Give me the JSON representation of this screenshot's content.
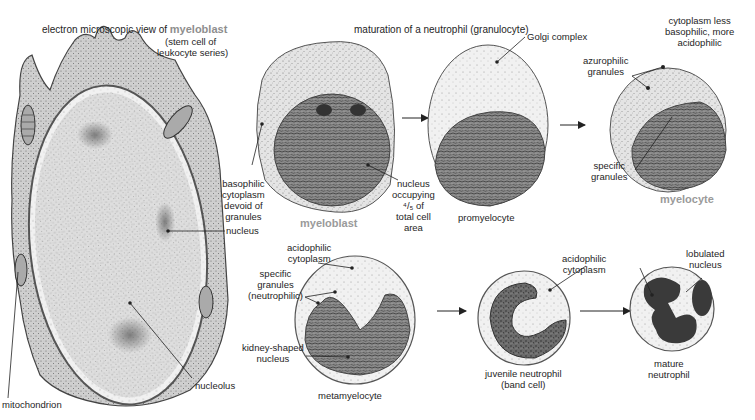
{
  "figure": {
    "header_left": {
      "prefix": "electron microscopic view of",
      "emphasis": "myeloblast",
      "line2": "(stem cell of",
      "line3": "leukocyte series)"
    },
    "header_center": "maturation of a neutrophil (granulocyte)",
    "colors": {
      "background": "#ffffff",
      "cell_stipple": "#bdbdbd",
      "nucleus_dark": "#555555",
      "label_text": "#1e1e1e",
      "stage_title_grey": "#9a9a9a"
    }
  },
  "em_myeloblast": {
    "labels": {
      "nucleus": "nucleus",
      "nucleolus": "nucleolus",
      "mitochondrion": "mitochondrion"
    }
  },
  "stages": [
    {
      "id": "myeloblast",
      "name": "myeloblast",
      "emphasized": true,
      "labels": {
        "cytoplasm": [
          "basophilic",
          "cytoplasm",
          "devoid of",
          "granules"
        ],
        "nucleus": [
          "nucleus",
          "occupying",
          "⁴/₅ of",
          "total cell",
          "area"
        ]
      }
    },
    {
      "id": "promyelocyte",
      "name": "promyelocyte",
      "emphasized": false,
      "labels": {
        "golgi": "Golgi complex"
      }
    },
    {
      "id": "myelocyte",
      "name": "myelocyte",
      "emphasized": true,
      "labels": {
        "cytoplasm": [
          "cytoplasm less",
          "basophilic, more",
          "acidophilic"
        ],
        "azurophilic": [
          "azurophilic",
          "granules"
        ],
        "specific": [
          "specific",
          "granules"
        ]
      }
    },
    {
      "id": "metamyelocyte",
      "name": "metamyelocyte",
      "emphasized": false,
      "labels": {
        "cytoplasm": [
          "acidophilic",
          "cytoplasm"
        ],
        "granules": [
          "specific",
          "granules",
          "(neutrophilic)"
        ],
        "nucleus": [
          "kidney-shaped",
          "nucleus"
        ]
      }
    },
    {
      "id": "juvenile",
      "name": [
        "juvenile neutrophil",
        "(band cell)"
      ],
      "emphasized": false,
      "labels": {
        "cytoplasm": [
          "acidophilic",
          "cytoplasm"
        ]
      }
    },
    {
      "id": "mature",
      "name": [
        "mature",
        "neutrophil"
      ],
      "emphasized": false,
      "labels": {
        "nucleus": [
          "lobulated",
          "nucleus"
        ]
      }
    }
  ]
}
